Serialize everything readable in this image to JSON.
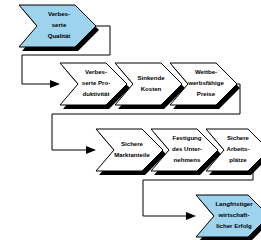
{
  "diagram": {
    "type": "chevron-flow",
    "background_color": "#ffffff",
    "accent_color": "#9DD3EC",
    "node_fill_color": "#ffffff",
    "outline_color": "#000000",
    "shadow_color": "#000000",
    "rows": [
      {
        "row_index": 0,
        "nodes": [
          {
            "id": "verbesserte-qualitaet",
            "fill": "#9DD3EC",
            "lines": [
              "Verbes-",
              "serte",
              "Qualität"
            ]
          }
        ]
      },
      {
        "row_index": 1,
        "nodes": [
          {
            "id": "verbesserte-produktivitaet",
            "fill": "#ffffff",
            "lines": [
              "Verbes-",
              "serte Pro-",
              "duktivität"
            ]
          },
          {
            "id": "sinkende-kosten",
            "fill": "#ffffff",
            "lines": [
              "Sinkende",
              "Kosten"
            ]
          },
          {
            "id": "wettbewerbsfaehige-preise",
            "fill": "#ffffff",
            "lines": [
              "Wettbe-",
              "werbsfähige",
              "Preise"
            ]
          }
        ]
      },
      {
        "row_index": 2,
        "nodes": [
          {
            "id": "sichere-marktanteile",
            "fill": "#ffffff",
            "lines": [
              "Sichere",
              "Marktanteile"
            ]
          },
          {
            "id": "festigung-des-unternehmens",
            "fill": "#ffffff",
            "lines": [
              "Festigung",
              "des Unter-",
              "nehmens"
            ]
          },
          {
            "id": "sichere-arbeitsplaetze",
            "fill": "#ffffff",
            "lines": [
              "Sichere",
              "Arbeits-",
              "plätze"
            ]
          }
        ]
      },
      {
        "row_index": 3,
        "nodes": [
          {
            "id": "langfristiger-wirtschaftlicher-erfolg",
            "fill": "#9DD3EC",
            "lines": [
              "Langfristiger",
              "wirtschaft-",
              "licher Erfolg"
            ]
          }
        ]
      }
    ],
    "connectors": [
      {
        "id": "conn-row0-to-row1",
        "from": "verbesserte-qualitaet",
        "to": "verbesserte-produktivitaet"
      },
      {
        "id": "conn-row1-to-row2",
        "from": "wettbewerbsfaehige-preise",
        "to": "sichere-marktanteile"
      },
      {
        "id": "conn-row2-to-row3",
        "from": "sichere-arbeitsplaetze",
        "to": "langfristiger-wirtschaftlicher-erfolg"
      }
    ]
  }
}
